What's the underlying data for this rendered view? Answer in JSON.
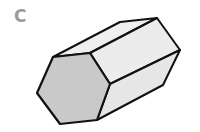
{
  "figure": {
    "label": "C",
    "shape": "hexagonal-prism",
    "colors": {
      "label": "#9a9a9a",
      "front_face": "#c9c9c9",
      "side_face_light": "#efefef",
      "side_face_mid": "#e6e6e6",
      "stroke": "#111111"
    }
  }
}
